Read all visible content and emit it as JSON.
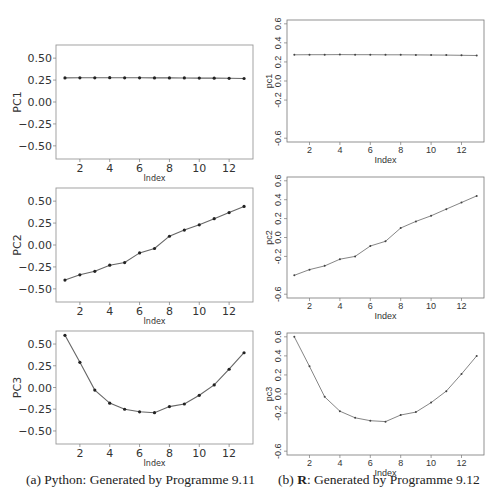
{
  "captions": {
    "a_prefix": "(a) Python: Generated by Programme 9.11",
    "b_prefix": "(b) ",
    "b_bold": "R",
    "b_rest": ": Generated by Programme 9.12"
  },
  "chart_data": [
    {
      "id": "python-pc1",
      "type": "line",
      "panel": "a",
      "style": "python",
      "title": "",
      "xlabel": "Index",
      "ylabel": "PC1",
      "x": [
        1,
        2,
        3,
        4,
        5,
        6,
        7,
        8,
        9,
        10,
        11,
        12,
        13
      ],
      "values": [
        0.275,
        0.276,
        0.276,
        0.277,
        0.276,
        0.276,
        0.275,
        0.275,
        0.274,
        0.273,
        0.272,
        0.27,
        0.268
      ],
      "xlim": [
        0.4,
        13.6
      ],
      "ylim": [
        -0.65,
        0.65
      ],
      "xticks": [
        2,
        4,
        6,
        8,
        10,
        12
      ],
      "yticks": [
        0.5,
        0.25,
        0.0,
        -0.25,
        -0.5
      ],
      "ytick_labels": [
        "0.50",
        "0.25",
        "0.00",
        "−0.25",
        "−0.50"
      ],
      "box": [
        56,
        45,
        197,
        114
      ],
      "grid": false
    },
    {
      "id": "python-pc2",
      "type": "line",
      "panel": "a",
      "style": "python",
      "title": "",
      "xlabel": "Index",
      "ylabel": "PC2",
      "x": [
        1,
        2,
        3,
        4,
        5,
        6,
        7,
        8,
        9,
        10,
        11,
        12,
        13
      ],
      "values": [
        -0.4,
        -0.34,
        -0.3,
        -0.23,
        -0.2,
        -0.09,
        -0.04,
        0.1,
        0.17,
        0.23,
        0.3,
        0.37,
        0.44
      ],
      "xlim": [
        0.4,
        13.6
      ],
      "ylim": [
        -0.65,
        0.65
      ],
      "xticks": [
        2,
        4,
        6,
        8,
        10,
        12
      ],
      "yticks": [
        0.5,
        0.25,
        0.0,
        -0.25,
        -0.5
      ],
      "ytick_labels": [
        "0.50",
        "0.25",
        "0.00",
        "−0.25",
        "−0.50"
      ],
      "box": [
        56,
        188,
        197,
        114
      ],
      "grid": false
    },
    {
      "id": "python-pc3",
      "type": "line",
      "panel": "a",
      "style": "python",
      "title": "",
      "xlabel": "Index",
      "ylabel": "PC3",
      "x": [
        1,
        2,
        3,
        4,
        5,
        6,
        7,
        8,
        9,
        10,
        11,
        12,
        13
      ],
      "values": [
        0.6,
        0.29,
        -0.03,
        -0.18,
        -0.25,
        -0.28,
        -0.29,
        -0.22,
        -0.19,
        -0.09,
        0.03,
        0.21,
        0.4
      ],
      "xlim": [
        0.4,
        13.6
      ],
      "ylim": [
        -0.65,
        0.65
      ],
      "xticks": [
        2,
        4,
        6,
        8,
        10,
        12
      ],
      "yticks": [
        0.5,
        0.25,
        0.0,
        -0.25,
        -0.5
      ],
      "ytick_labels": [
        "0.50",
        "0.25",
        "0.00",
        "−0.25",
        "−0.50"
      ],
      "box": [
        56,
        331,
        197,
        113
      ],
      "grid": false
    },
    {
      "id": "r-pc1",
      "type": "line",
      "panel": "b",
      "style": "r",
      "title": "",
      "xlabel": "Index",
      "ylabel": "pc1",
      "x": [
        1,
        2,
        3,
        4,
        5,
        6,
        7,
        8,
        9,
        10,
        11,
        12,
        13
      ],
      "values": [
        0.275,
        0.276,
        0.276,
        0.277,
        0.276,
        0.276,
        0.275,
        0.275,
        0.274,
        0.273,
        0.272,
        0.27,
        0.268
      ],
      "xlim": [
        0.52,
        13.48
      ],
      "ylim": [
        -0.64,
        0.64
      ],
      "xticks": [
        2,
        4,
        6,
        8,
        10,
        12
      ],
      "yticks": [
        0.6,
        0.4,
        0.2,
        0.0,
        -0.2,
        -0.6
      ],
      "ytick_labels": [
        "0.6",
        "0.4",
        "0.2",
        "0.0",
        "-0.2",
        "-0.6"
      ],
      "box": [
        287,
        20,
        197,
        122
      ],
      "grid": false
    },
    {
      "id": "r-pc2",
      "type": "line",
      "panel": "b",
      "style": "r",
      "title": "",
      "xlabel": "Index",
      "ylabel": "pc2",
      "x": [
        1,
        2,
        3,
        4,
        5,
        6,
        7,
        8,
        9,
        10,
        11,
        12,
        13
      ],
      "values": [
        -0.4,
        -0.34,
        -0.3,
        -0.23,
        -0.2,
        -0.09,
        -0.04,
        0.1,
        0.17,
        0.23,
        0.3,
        0.37,
        0.44
      ],
      "xlim": [
        0.52,
        13.48
      ],
      "ylim": [
        -0.64,
        0.64
      ],
      "xticks": [
        2,
        4,
        6,
        8,
        10,
        12
      ],
      "yticks": [
        0.6,
        0.4,
        0.2,
        0.0,
        -0.2,
        -0.6
      ],
      "ytick_labels": [
        "0.6",
        "0.4",
        "0.2",
        "0.0",
        "-0.2",
        "-0.6"
      ],
      "box": [
        287,
        177,
        197,
        121
      ],
      "grid": false
    },
    {
      "id": "r-pc3",
      "type": "line",
      "panel": "b",
      "style": "r",
      "title": "",
      "xlabel": "Index",
      "ylabel": "pc3",
      "x": [
        1,
        2,
        3,
        4,
        5,
        6,
        7,
        8,
        9,
        10,
        11,
        12,
        13
      ],
      "values": [
        0.6,
        0.29,
        -0.03,
        -0.18,
        -0.25,
        -0.28,
        -0.29,
        -0.22,
        -0.19,
        -0.09,
        0.03,
        0.21,
        0.4
      ],
      "xlim": [
        0.52,
        13.48
      ],
      "ylim": [
        -0.64,
        0.64
      ],
      "xticks": [
        2,
        4,
        6,
        8,
        10,
        12
      ],
      "yticks": [
        0.6,
        0.4,
        0.2,
        0.0,
        -0.2,
        -0.6
      ],
      "ytick_labels": [
        "0.6",
        "0.4",
        "0.2",
        "0.0",
        "-0.2",
        "-0.6"
      ],
      "box": [
        287,
        333,
        197,
        122
      ],
      "grid": false
    }
  ],
  "colors": {
    "line": "#555555",
    "marker": "#222222",
    "frame": "#888888",
    "text": "#333333"
  }
}
